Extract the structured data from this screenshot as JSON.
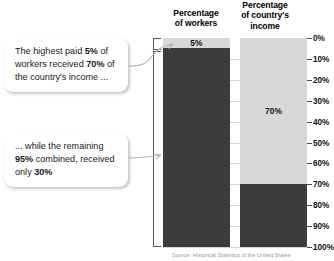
{
  "headers": {
    "workers": "Percentage\nof workers",
    "workers_line1": "Percentage",
    "workers_line2": "of workers",
    "income_line1": "Percentage",
    "income_line2": "of country's",
    "income_line3": "income"
  },
  "callouts": [
    {
      "id": "callout-one",
      "segments": [
        {
          "text": "The highest paid ",
          "bold": false
        },
        {
          "text": "5%",
          "bold": true
        },
        {
          "text": " of workers received ",
          "bold": false
        },
        {
          "text": "70%",
          "bold": true
        },
        {
          "text": " of the country's income ...",
          "bold": false
        }
      ]
    },
    {
      "id": "callout-two",
      "segments": [
        {
          "text": "... while the remaining ",
          "bold": false
        },
        {
          "text": "95%",
          "bold": true
        },
        {
          "text": " combined, received only ",
          "bold": false
        },
        {
          "text": "30%",
          "bold": true
        }
      ]
    }
  ],
  "axis": {
    "ticks": [
      "0%",
      "10%",
      "20%",
      "30%",
      "40%",
      "50%",
      "60%",
      "70%",
      "80%",
      "90%",
      "100%"
    ],
    "min": 0,
    "max": 100,
    "step": 10
  },
  "bar_labels": {
    "workers_top": "5%",
    "income_top": "70%"
  },
  "source": "Source: Historical Statistics of the United States",
  "colors": {
    "light_segment": "#d8d8d8",
    "dark_segment": "#3c3c3c",
    "gridline": "#cfcfcf",
    "bracket": "#585858",
    "callout_background": "#ffffff",
    "text": "#1a1a1a"
  },
  "chart_data": {
    "type": "bar",
    "title": "",
    "subtitle": "",
    "xlabel": "",
    "ylabel": "",
    "ylim": [
      0,
      100
    ],
    "y_inverted": true,
    "grid": true,
    "legend": "none",
    "categories": [
      "Percentage of workers",
      "Percentage of country's income"
    ],
    "series": [
      {
        "name": "Highest paid group (light)",
        "values": [
          5,
          70
        ],
        "color": "#d8d8d8",
        "labels": [
          "5%",
          "70%"
        ]
      },
      {
        "name": "Remaining group (dark)",
        "values": [
          95,
          30
        ],
        "color": "#3c3c3c",
        "labels": [
          "",
          ""
        ]
      }
    ],
    "stacked": true,
    "tick_labels": [
      "0%",
      "10%",
      "20%",
      "30%",
      "40%",
      "50%",
      "60%",
      "70%",
      "80%",
      "90%",
      "100%"
    ],
    "annotations": [
      "The highest paid 5% of workers received 70% of the country's income ...",
      "... while the remaining 95% combined, received only 30%"
    ]
  }
}
